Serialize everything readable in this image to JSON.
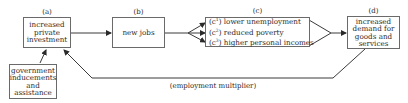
{
  "diagram": {
    "nodes": {
      "a": {
        "tag": "(a)",
        "text": "increased private investment",
        "lines": [
          "increased",
          "private",
          "investment"
        ]
      },
      "b": {
        "tag": "(b)",
        "text": "new jobs"
      },
      "c": {
        "tag": "(c)",
        "items": [
          {
            "marker": "c",
            "sup": "1",
            "text": "lower unemployment"
          },
          {
            "marker": "c",
            "sup": "2",
            "text": "reduced poverty"
          },
          {
            "marker": "c",
            "sup": "3",
            "text": "higher personal incomes"
          }
        ]
      },
      "d": {
        "tag": "(d)",
        "lines": [
          "increased",
          "demand for",
          "goods and",
          "services"
        ]
      },
      "gov": {
        "lines": [
          "government",
          "inducements",
          "and",
          "assistance"
        ]
      }
    },
    "edges": [
      {
        "from": "a",
        "to": "b"
      },
      {
        "from": "b",
        "to": "c1"
      },
      {
        "from": "b",
        "to": "c2"
      },
      {
        "from": "b",
        "to": "c3"
      },
      {
        "from": "c",
        "to": "d"
      },
      {
        "from": "gov",
        "to": "a"
      },
      {
        "from": "d",
        "to": "a",
        "label": "(employment multiplier)"
      }
    ],
    "feedback_label": "(employment multiplier)",
    "line_color": "#4a4a4a"
  }
}
